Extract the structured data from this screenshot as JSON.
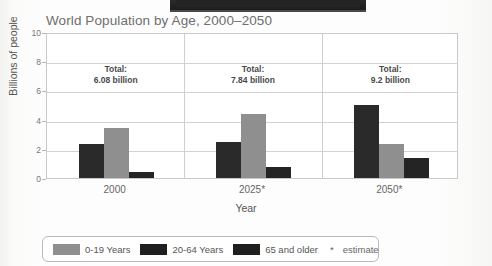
{
  "chart_data": {
    "type": "bar",
    "title": "World Population by Age, 2000–2050",
    "xlabel": "Year",
    "ylabel": "Billions of people",
    "categories": [
      "2000",
      "2025*",
      "2050*"
    ],
    "ylim": [
      0,
      10
    ],
    "yticks": [
      "0",
      "2",
      "4",
      "6",
      "8",
      "10"
    ],
    "grid": true,
    "legend_position": "bottom",
    "series": [
      {
        "name": "0-19 Years",
        "color": "#8f8f8f",
        "values": [
          3.4,
          4.4,
          2.35
        ]
      },
      {
        "name": "20-64 Years",
        "color": "#2a2a2a",
        "values": [
          2.3,
          2.5,
          5.0
        ]
      },
      {
        "name": "65 and older",
        "color": "#242424",
        "values": [
          0.4,
          0.75,
          1.35
        ]
      }
    ],
    "annotations": [
      {
        "label": "Total:",
        "value": "6.08 billion"
      },
      {
        "label": "Total:",
        "value": "7.84 billion"
      },
      {
        "label": "Total:",
        "value": "9.2 billion"
      }
    ],
    "footnote": {
      "symbol": "*",
      "text": "estimate"
    }
  },
  "legend": {
    "items": [
      {
        "label": "0-19 Years"
      },
      {
        "label": "20-64 Years"
      },
      {
        "label": "65 and older"
      }
    ]
  }
}
